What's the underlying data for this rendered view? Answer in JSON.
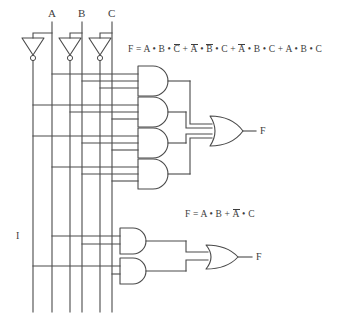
{
  "diagram": {
    "input_labels": [
      "A",
      "B",
      "C"
    ],
    "bus_note": "I",
    "outputs": [
      {
        "label": "F"
      },
      {
        "label": "F"
      }
    ],
    "equations": [
      {
        "id": "eq-top",
        "plain": "F = A•B•C̄ + Ā•B̄•C + Ā•B•C + A•B•C",
        "lhs": "F",
        "eq_sign": "=",
        "terms": [
          {
            "factors": [
              {
                "var": "A",
                "bar": false
              },
              {
                "var": "B",
                "bar": false
              },
              {
                "var": "C",
                "bar": true
              }
            ]
          },
          {
            "factors": [
              {
                "var": "A",
                "bar": true
              },
              {
                "var": "B",
                "bar": true
              },
              {
                "var": "C",
                "bar": false
              }
            ]
          },
          {
            "factors": [
              {
                "var": "A",
                "bar": true
              },
              {
                "var": "B",
                "bar": false
              },
              {
                "var": "C",
                "bar": false
              }
            ]
          },
          {
            "factors": [
              {
                "var": "A",
                "bar": false
              },
              {
                "var": "B",
                "bar": false
              },
              {
                "var": "C",
                "bar": false
              }
            ]
          }
        ]
      },
      {
        "id": "eq-bottom",
        "plain": "F = A•B + Ā•C",
        "lhs": "F",
        "eq_sign": "=",
        "terms": [
          {
            "factors": [
              {
                "var": "A",
                "bar": false
              },
              {
                "var": "B",
                "bar": false
              }
            ]
          },
          {
            "factors": [
              {
                "var": "A",
                "bar": true
              },
              {
                "var": "C",
                "bar": false
              }
            ]
          }
        ]
      }
    ],
    "gates": {
      "inverters": [
        {
          "name": "inverter-a",
          "input": "A",
          "output": "A-bar"
        },
        {
          "name": "inverter-b",
          "input": "B",
          "output": "B-bar"
        },
        {
          "name": "inverter-c",
          "input": "C",
          "output": "C-bar"
        }
      ],
      "and_gates_top": [
        {
          "name": "and-gate-1",
          "inputs": [
            "A",
            "B",
            "C-bar"
          ]
        },
        {
          "name": "and-gate-2",
          "inputs": [
            "A-bar",
            "B-bar",
            "C"
          ]
        },
        {
          "name": "and-gate-3",
          "inputs": [
            "A-bar",
            "B",
            "C"
          ]
        },
        {
          "name": "and-gate-4",
          "inputs": [
            "A",
            "B",
            "C"
          ]
        }
      ],
      "or_gate_top": {
        "name": "or-gate-top",
        "inputs": 4
      },
      "and_gates_bottom": [
        {
          "name": "and-gate-5",
          "inputs": [
            "A",
            "B"
          ]
        },
        {
          "name": "and-gate-6",
          "inputs": [
            "A-bar",
            "C"
          ]
        }
      ],
      "or_gate_bottom": {
        "name": "or-gate-bottom",
        "inputs": 2
      }
    },
    "buses": [
      {
        "name": "bus-a-bar",
        "signal": "A-bar",
        "x": 33
      },
      {
        "name": "bus-a",
        "signal": "A",
        "x": 52
      },
      {
        "name": "bus-b-bar",
        "signal": "B-bar",
        "x": 70
      },
      {
        "name": "bus-b",
        "signal": "B",
        "x": 82
      },
      {
        "name": "bus-c-bar",
        "signal": "C-bar",
        "x": 100
      },
      {
        "name": "bus-c",
        "signal": "C",
        "x": 112
      }
    ],
    "colors": {
      "ink": "#4a4a4a",
      "text": "#3d3d3d",
      "background": "#ffffff"
    }
  }
}
